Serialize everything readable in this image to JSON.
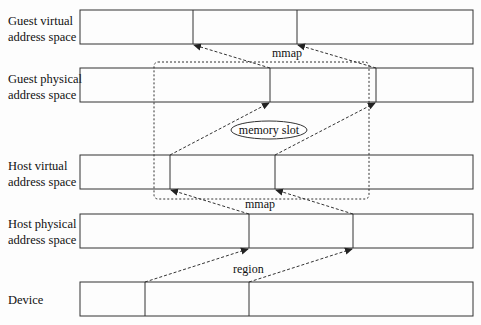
{
  "rows": [
    {
      "label": "Guest virtual\naddress space",
      "y": 10,
      "h": 34,
      "dividers": [
        193,
        297
      ]
    },
    {
      "label": "Guest physical\naddress space",
      "y": 68,
      "h": 34,
      "dividers": [
        270,
        376
      ]
    },
    {
      "label": "Host virtual\naddress space",
      "y": 155,
      "h": 34,
      "dividers": [
        170,
        275
      ]
    },
    {
      "label": "Host physical\naddress space",
      "y": 214,
      "h": 34,
      "dividers": [
        249,
        353
      ]
    },
    {
      "label": "Device",
      "y": 282,
      "h": 34,
      "dividers": [
        145,
        249
      ]
    }
  ],
  "box": {
    "x": 80,
    "w": 393
  },
  "labels": {
    "mmap_top": "mmap",
    "mmap_bottom": "mmap",
    "region": "region",
    "memory_slot": "memory slot"
  },
  "colors": {
    "line": "#333333",
    "text": "#111111"
  }
}
